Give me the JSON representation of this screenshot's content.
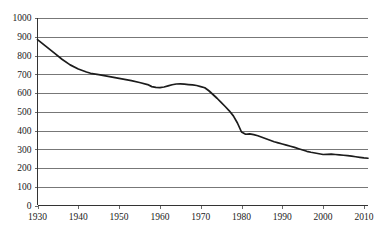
{
  "chart_data": {
    "type": "line",
    "title": "",
    "subtitle": "",
    "xlabel": "",
    "ylabel": "",
    "xlim": [
      1930,
      2011
    ],
    "ylim": [
      0,
      1000
    ],
    "grid": true,
    "legend": false,
    "legend_position": "none",
    "line_color": "#1c1c1c",
    "grid_color": "#555555",
    "axis_color": "#333333",
    "y_ticks": [
      0,
      100,
      200,
      300,
      400,
      500,
      600,
      700,
      800,
      900,
      1000
    ],
    "y_tick_labels": [
      "0",
      "100",
      "200",
      "300",
      "400",
      "500",
      "600",
      "700",
      "800",
      "900",
      "1000"
    ],
    "x_ticks": [
      1930,
      1940,
      1950,
      1960,
      1970,
      1980,
      1990,
      2000,
      2010
    ],
    "x_tick_labels": [
      "1930",
      "1940",
      "1950",
      "1960",
      "1970",
      "1980",
      "1990",
      "2000",
      "2010"
    ],
    "series": [
      {
        "name": "series-1",
        "x": [
          1930,
          1932,
          1934,
          1936,
          1938,
          1940,
          1942,
          1943,
          1945,
          1947,
          1949,
          1951,
          1953,
          1955,
          1957,
          1958,
          1959,
          1960,
          1961,
          1962,
          1963,
          1964,
          1965,
          1966,
          1967,
          1968,
          1969,
          1970,
          1971,
          1972,
          1973,
          1974,
          1975,
          1976,
          1977,
          1978,
          1979,
          1980,
          1981,
          1982,
          1983,
          1984,
          1985,
          1986,
          1987,
          1988,
          1989,
          1990,
          1991,
          1992,
          1993,
          1994,
          1995,
          1996,
          1997,
          1998,
          1999,
          2000,
          2001,
          2002,
          2003,
          2004,
          2005,
          2006,
          2007,
          2008,
          2009,
          2010,
          2011
        ],
        "y": [
          885,
          850,
          815,
          780,
          750,
          728,
          712,
          705,
          698,
          690,
          682,
          674,
          666,
          656,
          645,
          634,
          630,
          629,
          632,
          638,
          644,
          648,
          649,
          647,
          645,
          643,
          640,
          634,
          628,
          612,
          592,
          572,
          550,
          528,
          505,
          478,
          440,
          392,
          380,
          382,
          378,
          372,
          364,
          356,
          348,
          340,
          334,
          328,
          322,
          316,
          310,
          303,
          296,
          289,
          284,
          280,
          276,
          272,
          273,
          274,
          272,
          270,
          268,
          266,
          263,
          260,
          257,
          254,
          252
        ]
      }
    ]
  },
  "axes": {
    "y_axis_name": "y-axis",
    "x_axis_name": "x-axis"
  }
}
